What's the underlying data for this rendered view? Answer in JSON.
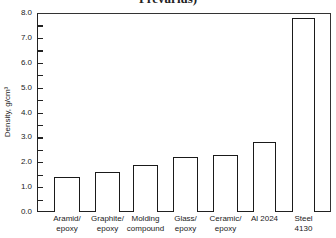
{
  "title_fragment": "Prevarius)",
  "chart_data": {
    "type": "bar",
    "title": "",
    "xlabel": "",
    "ylabel": "Density, g/cm³",
    "ylim": [
      0,
      8
    ],
    "yticks": [
      "0.0",
      "1.0",
      "2.0",
      "3.0",
      "4.0",
      "5.0",
      "6.0",
      "7.0",
      "8.0"
    ],
    "grid": false,
    "legend": null,
    "categories": [
      "Aramid/ epoxy",
      "Graphite/ epoxy",
      "Molding compound",
      "Glass/ epoxy",
      "Ceramic/ epoxy",
      "Al 2024",
      "Steel 4130"
    ],
    "category_lines": [
      [
        "Aramid/",
        "epoxy"
      ],
      [
        "Graphite/",
        "epoxy"
      ],
      [
        "Molding",
        "compound"
      ],
      [
        "Glass/",
        "epoxy"
      ],
      [
        "Ceramic/",
        "epoxy"
      ],
      [
        "Al 2024",
        ""
      ],
      [
        "Steel",
        "4130"
      ]
    ],
    "values": [
      1.4,
      1.6,
      1.9,
      2.2,
      2.3,
      2.8,
      7.8
    ]
  }
}
